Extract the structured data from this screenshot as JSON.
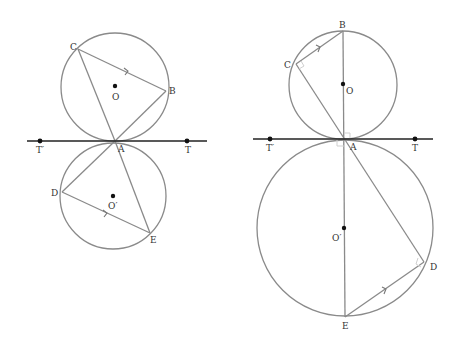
{
  "figure_left": {
    "title": "Alternate segment theorem — general triangle",
    "labels": {
      "C": "C",
      "B": "B",
      "O": "O",
      "A": "A",
      "T_prime": "T′",
      "T": "T",
      "D": "D",
      "O_prime": "O′",
      "E": "E"
    }
  },
  "figure_right": {
    "title": "Alternate segment theorem — diameter case",
    "labels": {
      "B": "B",
      "C": "C",
      "O": "O",
      "A": "A",
      "T_prime": "T′",
      "T": "T",
      "O_prime": "O′",
      "D": "D",
      "E": "E"
    }
  },
  "colors": {
    "circle": "#8a8a8a",
    "tangent": "#222222",
    "point": "#111111",
    "label": "#333333"
  }
}
